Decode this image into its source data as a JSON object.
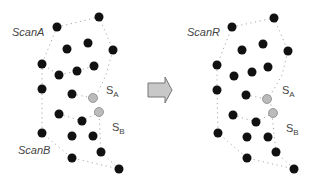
{
  "labels": {
    "scanA": "ScanA",
    "scanB": "ScanB",
    "scanR": "ScanR",
    "sA_main": "S",
    "sA_sub": "A",
    "sB_main": "S",
    "sB_sub": "B"
  },
  "colors": {
    "dot": "#111111",
    "grey_dot": "#bbbbbb",
    "boundary": "#aaaaaa",
    "arrow_fill": "#c8c8c8",
    "arrow_stroke": "#777777"
  },
  "left_panel": {
    "black_points": [
      [
        57,
        27
      ],
      [
        99,
        17
      ],
      [
        67,
        49
      ],
      [
        88,
        43
      ],
      [
        113,
        50
      ],
      [
        42,
        64
      ],
      [
        59,
        75
      ],
      [
        77,
        71
      ],
      [
        94,
        66
      ],
      [
        42,
        89
      ],
      [
        72,
        94
      ],
      [
        59,
        114
      ],
      [
        82,
        121
      ],
      [
        42,
        133
      ],
      [
        72,
        136
      ],
      [
        93,
        136
      ],
      [
        101,
        152
      ],
      [
        72,
        158
      ],
      [
        119,
        169
      ]
    ],
    "grey_points": [
      [
        93,
        98
      ],
      [
        99,
        112
      ]
    ]
  },
  "right_panel": {
    "black_points": [
      [
        232,
        27
      ],
      [
        274,
        18
      ],
      [
        242,
        50
      ],
      [
        263,
        44
      ],
      [
        288,
        51
      ],
      [
        217,
        65
      ],
      [
        234,
        76
      ],
      [
        252,
        72
      ],
      [
        268,
        67
      ],
      [
        217,
        90
      ],
      [
        246,
        95
      ],
      [
        233,
        115
      ],
      [
        256,
        122
      ],
      [
        218,
        133
      ],
      [
        247,
        137
      ],
      [
        268,
        137
      ],
      [
        276,
        152
      ],
      [
        247,
        158
      ],
      [
        294,
        169
      ]
    ],
    "grey_points": [
      [
        267,
        99
      ],
      [
        273,
        113
      ]
    ]
  }
}
